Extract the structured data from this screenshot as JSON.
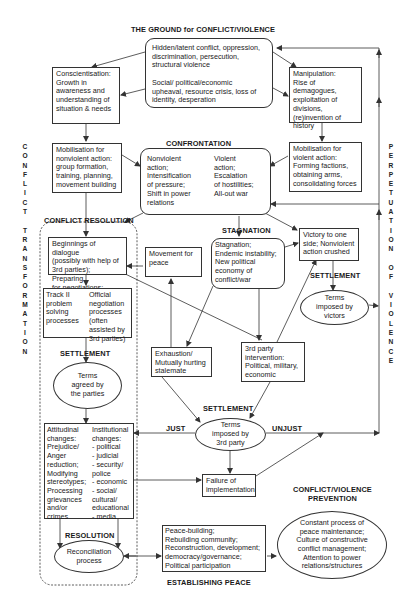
{
  "headers": {
    "ground": "THE GROUND for CONFLICT/VIOLENCE",
    "confrontation": "CONFRONTATION",
    "conflict_resolution": "CONFLICT RESOLUTION",
    "stagnation": "STAGNATION",
    "settlement_left": "SETTLEMENT",
    "settlement_right": "SETTLEMENT",
    "settlement_center": "SETTLEMENT",
    "just": "JUST",
    "unjust": "UNJUST",
    "resolution": "RESOLUTION",
    "establishing_peace": "ESTABLISHING PEACE",
    "prevention": "CONFLICT/VIOLENCE\nPREVENTION"
  },
  "side_labels": {
    "left": "C\nO\nN\nF\nL\nI\nC\nT\n\nT\nR\nA\nN\nS\nF\nO\nR\nM\nA\nT\nI\nO\nN",
    "right": "P\nE\nR\nP\nE\nT\nU\nA\nT\nI\nO\nN\n\nO\nF\n\nV\nI\nO\nL\nE\nN\nC\nE"
  },
  "nodes": {
    "ground_top": "Hidden/latent conflict, oppression,\ndiscrimination, persecution,\nstructural violence",
    "ground_bottom": "Social/ political/economic\nupheaval, resource crisis, loss of\nidentity, desperation",
    "conscientisation": "Conscientisation:\nGrowth in\nawareness and\nunderstanding of\nsituation & needs",
    "manipulation": "Manipulation:\nRise of demagogues,\nexploitation of\ndivisions,\n(re)invention of\nhistory",
    "mobilisation_nonviolent": "Mobilisation for\nnonviolent action:\ngroup formation,\ntraining, planning,\nmovement building",
    "mobilisation_violent": "Mobilisation for\nviolent action:\nForming factions,\nobtaining arms,\nconsolidating forces",
    "confrontation_nonviolent": "Nonviolent\naction;\nIntensification\nof pressure;\nShift in power\nrelations",
    "confrontation_violent": "Violent\naction;\nEscalation\nof hostilities;\nAll-out war",
    "dialogue": "Beginnings of dialogue\n(possibly with help of\n3rd parties); Preparing\nfor negotiations; CBMs",
    "movement_for_peace": "Movement for\npeace",
    "stagnation": "Stagnation;\nEndemic instability;\nNew political\neconomy of\nconflict/war",
    "victory": "Victory to one\nside; Nonviolent\naction crushed",
    "track_ii": "Track II\nproblem\nsolving\nprocesses",
    "official_negotiation": "Official\nnegotiation\nprocesses\n(often\nassisted by\n3rd parties)",
    "terms_victors": "Terms\nimposed by\nvictors",
    "terms_agreed": "Terms\nagreed by\nthe parties",
    "exhaustion": "Exhaustion/\nMutually hurting\nstalemate",
    "third_party": "3rd party\nintervention:\nPolitical, military,\neconomic",
    "terms_third_party": "Terms\nimposed by\n3rd party",
    "attitudinal": "Attitudinal\nchanges:\nPrejudice/\nAnger\nreduction;\nModifying\nstereotypes;\nProcessing\ngrievances\nand/or\ncrimes",
    "institutional": "Institutional\nchanges:\n- political\n- judicial\n- security/\npolice\n- economic\n- social/\ncultural/\neducational\n- media",
    "failure": "Failure of\nimplementation",
    "reconciliation": "Reconciliation\nprocess",
    "peace_building": "Peace-building;\nRebuilding community;\nReconstruction, development;\ndemocracy/governance;\nPolitical participation",
    "prevention": "Constant process of\npeace maintenance;\nCulture of constructive\nconflict management;\nAttention to power\nrelations/structures"
  },
  "colors": {
    "line": "#333333",
    "text": "#1a1a1a",
    "background": "#ffffff"
  }
}
